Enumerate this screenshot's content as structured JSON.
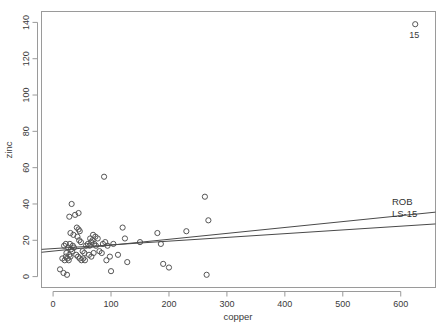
{
  "chart_data": {
    "type": "scatter",
    "title": "",
    "xlabel": "copper",
    "ylabel": "zinc",
    "xlim": [
      -20,
      660
    ],
    "ylim": [
      -6,
      146
    ],
    "xticks": [
      0,
      100,
      200,
      300,
      400,
      500,
      600
    ],
    "yticks": [
      0,
      20,
      40,
      60,
      80,
      100,
      120,
      140
    ],
    "xtick_labels": [
      "0",
      "100",
      "200",
      "300",
      "400",
      "500",
      "600"
    ],
    "ytick_labels": [
      "0",
      "20",
      "40",
      "60",
      "80",
      "100",
      "120",
      "140"
    ],
    "grid": false,
    "legend_position": "right-inline",
    "point_marker": "open-circle",
    "points": [
      {
        "x": 12,
        "y": 4
      },
      {
        "x": 18,
        "y": 2
      },
      {
        "x": 24,
        "y": 1
      },
      {
        "x": 16,
        "y": 10
      },
      {
        "x": 20,
        "y": 9
      },
      {
        "x": 22,
        "y": 11
      },
      {
        "x": 25,
        "y": 10
      },
      {
        "x": 27,
        "y": 9
      },
      {
        "x": 23,
        "y": 13
      },
      {
        "x": 28,
        "y": 12
      },
      {
        "x": 30,
        "y": 11
      },
      {
        "x": 26,
        "y": 16
      },
      {
        "x": 31,
        "y": 15
      },
      {
        "x": 33,
        "y": 14
      },
      {
        "x": 19,
        "y": 17
      },
      {
        "x": 22,
        "y": 18
      },
      {
        "x": 29,
        "y": 18
      },
      {
        "x": 34,
        "y": 17
      },
      {
        "x": 36,
        "y": 16
      },
      {
        "x": 30,
        "y": 24
      },
      {
        "x": 35,
        "y": 23
      },
      {
        "x": 28,
        "y": 33
      },
      {
        "x": 32,
        "y": 40
      },
      {
        "x": 38,
        "y": 34
      },
      {
        "x": 44,
        "y": 35
      },
      {
        "x": 41,
        "y": 27
      },
      {
        "x": 44,
        "y": 26
      },
      {
        "x": 46,
        "y": 25
      },
      {
        "x": 42,
        "y": 22
      },
      {
        "x": 45,
        "y": 20
      },
      {
        "x": 48,
        "y": 19
      },
      {
        "x": 40,
        "y": 12
      },
      {
        "x": 43,
        "y": 11
      },
      {
        "x": 46,
        "y": 10
      },
      {
        "x": 49,
        "y": 9
      },
      {
        "x": 52,
        "y": 10
      },
      {
        "x": 55,
        "y": 9
      },
      {
        "x": 51,
        "y": 14
      },
      {
        "x": 54,
        "y": 13
      },
      {
        "x": 57,
        "y": 17
      },
      {
        "x": 60,
        "y": 18
      },
      {
        "x": 63,
        "y": 17
      },
      {
        "x": 66,
        "y": 19
      },
      {
        "x": 64,
        "y": 21
      },
      {
        "x": 68,
        "y": 20
      },
      {
        "x": 71,
        "y": 18
      },
      {
        "x": 74,
        "y": 17
      },
      {
        "x": 69,
        "y": 23
      },
      {
        "x": 73,
        "y": 22
      },
      {
        "x": 77,
        "y": 21
      },
      {
        "x": 62,
        "y": 12
      },
      {
        "x": 66,
        "y": 11
      },
      {
        "x": 70,
        "y": 13
      },
      {
        "x": 80,
        "y": 14
      },
      {
        "x": 84,
        "y": 13
      },
      {
        "x": 86,
        "y": 18
      },
      {
        "x": 90,
        "y": 19
      },
      {
        "x": 94,
        "y": 17
      },
      {
        "x": 88,
        "y": 55
      },
      {
        "x": 92,
        "y": 9
      },
      {
        "x": 100,
        "y": 3
      },
      {
        "x": 98,
        "y": 11
      },
      {
        "x": 104,
        "y": 18
      },
      {
        "x": 112,
        "y": 12
      },
      {
        "x": 120,
        "y": 27
      },
      {
        "x": 124,
        "y": 21
      },
      {
        "x": 128,
        "y": 8
      },
      {
        "x": 150,
        "y": 19
      },
      {
        "x": 180,
        "y": 24
      },
      {
        "x": 186,
        "y": 18
      },
      {
        "x": 190,
        "y": 7
      },
      {
        "x": 200,
        "y": 5
      },
      {
        "x": 230,
        "y": 25
      },
      {
        "x": 262,
        "y": 44
      },
      {
        "x": 268,
        "y": 31
      },
      {
        "x": 265,
        "y": 1
      },
      {
        "x": 625,
        "y": 139,
        "label": "15"
      }
    ],
    "lines": [
      {
        "name": "ROB",
        "x0": -20,
        "y0": 13.4,
        "x1": 660,
        "y1": 35.5
      },
      {
        "name": "LS-15",
        "x0": -20,
        "y0": 15.0,
        "x1": 660,
        "y1": 29.0
      }
    ]
  },
  "labels": {
    "outlier_point_label": "15",
    "rob_label": "ROB",
    "ls15_label": "LS-15",
    "x_axis_title": "copper",
    "y_axis_title": "zinc"
  },
  "colors": {
    "background": "#ffffff",
    "axis": "#9a9a9a",
    "point_stroke": "#555555",
    "line_stroke": "#4a4a4a",
    "text": "#3a3a3a"
  }
}
